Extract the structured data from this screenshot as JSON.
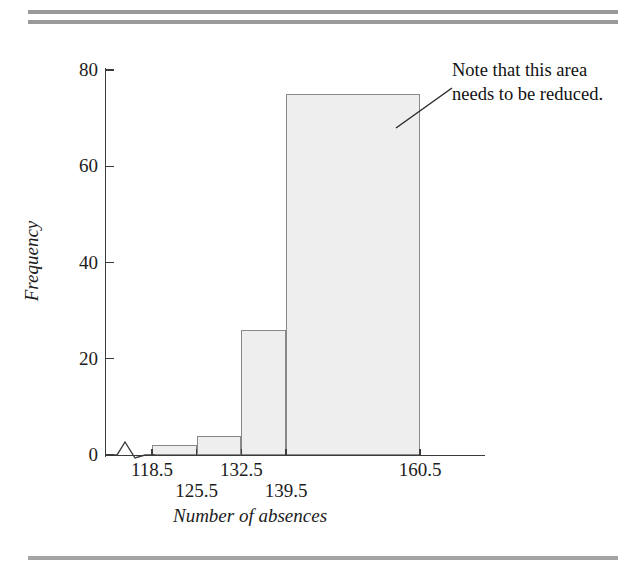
{
  "figure": {
    "annotation": {
      "line1": "Note that this area",
      "line2": "needs to be reduced."
    }
  },
  "chart_data": {
    "type": "bar",
    "title": "",
    "subtitle": "",
    "xlabel": "Number of absences",
    "ylabel": "Frequency",
    "categories": [
      "118.5-125.5",
      "125.5-132.5",
      "132.5-139.5",
      "139.5-160.5"
    ],
    "bin_edges": [
      118.5,
      125.5,
      132.5,
      139.5,
      160.5
    ],
    "values": [
      2,
      4,
      26,
      75
    ],
    "ylim": [
      0,
      80
    ],
    "yticks": [
      0,
      20,
      40,
      60,
      80
    ],
    "ytick_labels": [
      "0",
      "20",
      "40",
      "60",
      "80"
    ],
    "xtick_labels_upper": [
      "118.5",
      "132.5",
      "160.5"
    ],
    "xtick_labels_lower": [
      "125.5",
      "139.5"
    ],
    "grid": false,
    "legend": null,
    "axis_break": true,
    "annotations": [
      {
        "text": "Note that this area needs to be reduced.",
        "points_to": "139.5-160.5"
      }
    ],
    "bar_fill_color": "#eeeeee",
    "bar_edge_color": "#888888",
    "rule_color": "#9a9a9a"
  }
}
